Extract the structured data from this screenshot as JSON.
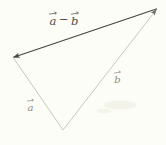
{
  "figure": {
    "labels": {
      "difference": {
        "lhs": "a",
        "operator": "−",
        "rhs": "b",
        "composed": "a⃗ − b⃗"
      },
      "side_a": "a",
      "side_b": "b"
    },
    "colors": {
      "background": "#fcfdf6",
      "difference_line": "#46443f",
      "side_lines": "#c4c1b5",
      "side_arrowhead": "#6f6c64",
      "difference_label": "#4e4b45",
      "side_labels": "#8e8b82"
    }
  }
}
